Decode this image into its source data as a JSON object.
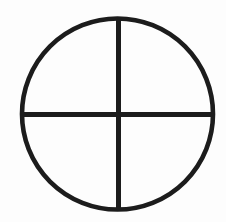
{
  "canvas": {
    "width": 226,
    "height": 222,
    "background_color": "#fdfdfd",
    "ink_color": "#1c1c1c"
  },
  "figure": {
    "name": "quartered-circle-symbol",
    "style": "hand-drawn scanned line art",
    "circle": {
      "center_x": 117.5,
      "center_y": 114,
      "radius": 95.5,
      "stroke_width": 4.6,
      "color": "#1c1c1c"
    },
    "vertical_diameter": {
      "x": 118.5,
      "y_start": 18.5,
      "y_end": 209.5,
      "stroke_width": 5,
      "color": "#1c1c1c"
    },
    "horizontal_diameter": {
      "y": 114.5,
      "x_start": 22.5,
      "x_end": 213,
      "stroke_width": 5,
      "color": "#1c1c1c"
    },
    "quadrant_labels": [
      "upper-left",
      "upper-right",
      "lower-left",
      "lower-right"
    ]
  }
}
